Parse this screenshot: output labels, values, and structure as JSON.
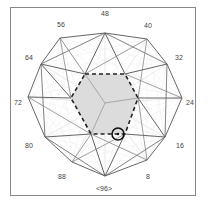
{
  "diagram": {
    "labels": [
      "48",
      "40",
      "32",
      "24",
      "16",
      "8",
      "<96>",
      "88",
      "80",
      "72",
      "64",
      "56"
    ],
    "fill_color": "#d8d8d8",
    "line_color": "#555555",
    "highlight": "circle-marker"
  }
}
